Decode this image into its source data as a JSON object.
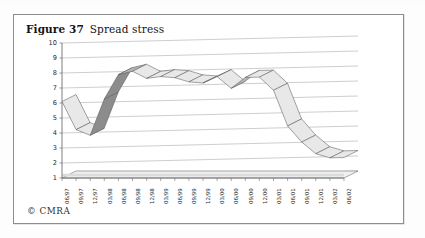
{
  "figure": {
    "label": "Figure 37",
    "title": "Spread stress",
    "copyright": "© CMRA"
  },
  "colors": {
    "frame_border": "#8d8d8d",
    "gridline": "#b9b9b9",
    "axis": "#6f6f6f",
    "ribbon_top_light": "#e8e8e8",
    "ribbon_top_dark": "#8c8c8c",
    "ribbon_edge": "#5a5a5a",
    "floor": "#f0f0f0",
    "text": "#1a1a1a"
  },
  "chart_data": {
    "type": "line",
    "title": "Spread stress",
    "xlabel": "",
    "ylabel": "",
    "ylim": [
      1,
      10
    ],
    "yticks": [
      1,
      2,
      3,
      4,
      5,
      6,
      7,
      8,
      9,
      10
    ],
    "grid": true,
    "legend": "none",
    "style": "3d-ribbon-line",
    "categories": [
      "06/97",
      "09/97",
      "12/97",
      "03/98",
      "06/98",
      "09/98",
      "12/98",
      "03/99",
      "06/99",
      "09/99",
      "12/99",
      "03/00",
      "06/00",
      "09/00",
      "12/00",
      "03/01",
      "06/01",
      "09/01",
      "12/01",
      "03/02",
      "06/02"
    ],
    "values": [
      6.1,
      4.2,
      3.8,
      6.2,
      7.8,
      8.0,
      7.5,
      7.6,
      7.5,
      7.2,
      7.1,
      7.5,
      6.7,
      7.4,
      7.4,
      6.5,
      4.1,
      3.0,
      2.2,
      1.9,
      1.9
    ],
    "series": [
      {
        "name": "Spread stress",
        "values": [
          6.1,
          4.2,
          3.8,
          6.2,
          7.8,
          8.0,
          7.5,
          7.6,
          7.5,
          7.2,
          7.1,
          7.5,
          6.7,
          7.4,
          7.4,
          6.5,
          4.1,
          3.0,
          2.2,
          1.9,
          1.9
        ]
      }
    ]
  }
}
